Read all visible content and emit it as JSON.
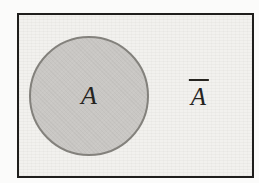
{
  "figure": {
    "type": "set-complement-venn-diagram",
    "set_label": "A",
    "complement_label": "Ā",
    "complement_base_letter": "A",
    "complement_has_overline": true
  },
  "colors": {
    "page_background": "#fbfbfa",
    "universe_fill": "#f2f1ee",
    "universe_border": "#1f1e1c",
    "set_fill": "#c9c7c4",
    "set_border": "#83817c",
    "label_color": "#26241f"
  }
}
